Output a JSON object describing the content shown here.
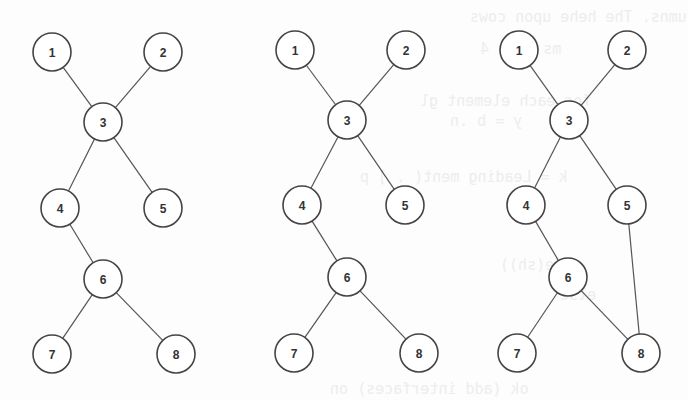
{
  "figure": {
    "type": "graph-diagrams",
    "node_radius": 19,
    "stroke_color": "#444444",
    "edge_color": "#555555",
    "background": "#fdfdfd",
    "graphs": [
      {
        "id": "graph-1",
        "nodes": [
          {
            "label": "1",
            "x": 52,
            "y": 52
          },
          {
            "label": "2",
            "x": 163,
            "y": 52
          },
          {
            "label": "3",
            "x": 103,
            "y": 122
          },
          {
            "label": "4",
            "x": 60,
            "y": 208
          },
          {
            "label": "5",
            "x": 163,
            "y": 208
          },
          {
            "label": "6",
            "x": 103,
            "y": 279
          },
          {
            "label": "7",
            "x": 52,
            "y": 354
          },
          {
            "label": "8",
            "x": 176,
            "y": 354
          }
        ],
        "edges": [
          [
            "1",
            "3"
          ],
          [
            "2",
            "3"
          ],
          [
            "3",
            "4"
          ],
          [
            "3",
            "5"
          ],
          [
            "4",
            "6"
          ],
          [
            "6",
            "7"
          ],
          [
            "6",
            "8"
          ]
        ]
      },
      {
        "id": "graph-2",
        "nodes": [
          {
            "label": "1",
            "x": 295,
            "y": 50
          },
          {
            "label": "2",
            "x": 406,
            "y": 50
          },
          {
            "label": "3",
            "x": 347,
            "y": 120
          },
          {
            "label": "4",
            "x": 302,
            "y": 205
          },
          {
            "label": "5",
            "x": 405,
            "y": 205
          },
          {
            "label": "6",
            "x": 347,
            "y": 277
          },
          {
            "label": "7",
            "x": 294,
            "y": 353
          },
          {
            "label": "8",
            "x": 419,
            "y": 353
          }
        ],
        "edges": [
          [
            "1",
            "3"
          ],
          [
            "2",
            "3"
          ],
          [
            "3",
            "4"
          ],
          [
            "3",
            "5"
          ],
          [
            "4",
            "6"
          ],
          [
            "6",
            "7"
          ],
          [
            "6",
            "8"
          ]
        ]
      },
      {
        "id": "graph-3",
        "nodes": [
          {
            "label": "1",
            "x": 519,
            "y": 50
          },
          {
            "label": "2",
            "x": 627,
            "y": 50
          },
          {
            "label": "3",
            "x": 569,
            "y": 120
          },
          {
            "label": "4",
            "x": 526,
            "y": 205
          },
          {
            "label": "5",
            "x": 627,
            "y": 205
          },
          {
            "label": "6",
            "x": 568,
            "y": 277
          },
          {
            "label": "7",
            "x": 517,
            "y": 353
          },
          {
            "label": "8",
            "x": 641,
            "y": 353
          }
        ],
        "edges": [
          [
            "1",
            "3"
          ],
          [
            "2",
            "3"
          ],
          [
            "3",
            "4"
          ],
          [
            "3",
            "5"
          ],
          [
            "4",
            "6"
          ],
          [
            "6",
            "7"
          ],
          [
            "6",
            "8"
          ],
          [
            "5",
            "8"
          ]
        ]
      }
    ]
  },
  "background_bleed_text": [
    {
      "text": "umns. The hehe upon cows",
      "x": 470,
      "y": 8
    },
    {
      "text": "ms  plus  4",
      "x": 480,
      "y": 40
    },
    {
      "text": "for each element  gl",
      "x": 420,
      "y": 92
    },
    {
      "text": "y = b .n",
      "x": 450,
      "y": 112
    },
    {
      "text": "k = Leading  ment(  . ] p",
      "x": 360,
      "y": 168
    },
    {
      "text": "mute(sh))",
      "x": 500,
      "y": 256
    },
    {
      "text": "else",
      "x": 560,
      "y": 286
    },
    {
      "text": "ok  (add interfaces)  on",
      "x": 330,
      "y": 380
    }
  ]
}
